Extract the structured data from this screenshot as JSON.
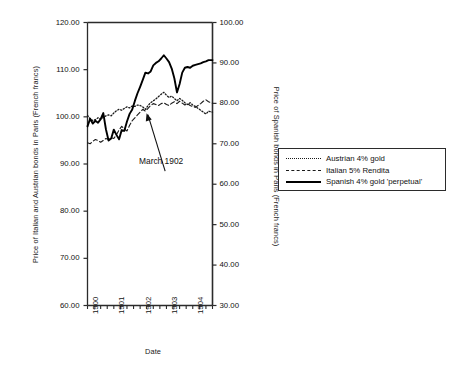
{
  "chart_data": {
    "type": "line",
    "title": "",
    "xlabel": "Date",
    "ylabel": "Price of Italian and Austrian bonds in Paris (French francs)",
    "y2label": "Price of Spanish bonds in Paris (French francs)",
    "xlim": [
      1900.0,
      1904.75
    ],
    "ylim": [
      60.0,
      120.0
    ],
    "y2lim": [
      30.0,
      100.0
    ],
    "grid": false,
    "legend_position": "right",
    "xticks": [
      "1900",
      "1901",
      "1902",
      "1903",
      "1904"
    ],
    "xtick_values": [
      1900,
      1901,
      1902,
      1903,
      1904
    ],
    "yticks": [
      "60.00",
      "70.00",
      "80.00",
      "90.00",
      "100.00",
      "110.00",
      "120.00"
    ],
    "ytick_values": [
      60,
      70,
      80,
      90,
      100,
      110,
      120
    ],
    "y2ticks": [
      "30.00",
      "40.00",
      "50.00",
      "60.00",
      "70.00",
      "80.00",
      "90.00",
      "100.00"
    ],
    "y2tick_values": [
      30,
      40,
      50,
      60,
      70,
      80,
      90,
      100
    ],
    "minor_xticks_per_year": 4,
    "annotations": [
      {
        "text": "March 1902",
        "point_x": 1902.2,
        "point_y": 101.0,
        "label_x": 1902.95,
        "label_y": 88.5
      }
    ],
    "series": [
      {
        "name": "Austrian 4% gold",
        "style": "dotted",
        "axis": "left",
        "color": "#1a1a1a",
        "x": [
          1900.0,
          1900.1,
          1900.2,
          1900.3,
          1900.4,
          1900.5,
          1900.6,
          1900.7,
          1900.8,
          1900.9,
          1901.0,
          1901.1,
          1901.2,
          1901.3,
          1901.4,
          1901.5,
          1901.6,
          1901.7,
          1901.8,
          1901.9,
          1902.0,
          1902.1,
          1902.2,
          1902.3,
          1902.4,
          1902.5,
          1902.6,
          1902.7,
          1902.8,
          1902.9,
          1903.0,
          1903.1,
          1903.2,
          1903.3,
          1903.4,
          1903.5,
          1903.6,
          1903.7,
          1903.8,
          1903.9,
          1904.0,
          1904.1,
          1904.2,
          1904.3,
          1904.4,
          1904.5,
          1904.6,
          1904.75
        ],
        "y": [
          100.3,
          99.6,
          99.2,
          99.4,
          99.8,
          99.5,
          99.9,
          100.2,
          100.4,
          100.2,
          100.8,
          101.3,
          101.6,
          101.4,
          101.8,
          102.1,
          101.9,
          102.3,
          102.2,
          102.5,
          102.4,
          102.1,
          101.6,
          102.4,
          103.0,
          103.4,
          103.8,
          104.3,
          104.8,
          105.2,
          104.6,
          104.1,
          104.4,
          103.9,
          103.4,
          103.9,
          103.5,
          103.0,
          102.6,
          103.0,
          102.5,
          102.2,
          101.8,
          101.4,
          101.0,
          100.6,
          101.2,
          101.0
        ]
      },
      {
        "name": "Italian 5% Rendita",
        "style": "dashed",
        "axis": "left",
        "color": "#1a1a1a",
        "x": [
          1900.0,
          1900.1,
          1900.2,
          1900.3,
          1900.4,
          1900.5,
          1900.6,
          1900.7,
          1900.8,
          1900.9,
          1901.0,
          1901.1,
          1901.2,
          1901.3,
          1901.4,
          1901.5,
          1901.6,
          1901.7,
          1901.8,
          1901.9,
          1902.0,
          1902.1,
          1902.2,
          1902.3,
          1902.4,
          1902.5,
          1902.6,
          1902.7,
          1902.8,
          1902.9,
          1903.0,
          1903.1,
          1903.2,
          1903.3,
          1903.4,
          1903.5,
          1903.6,
          1903.7,
          1903.8,
          1903.9,
          1904.0,
          1904.1,
          1904.2,
          1904.3,
          1904.4,
          1904.5,
          1904.6,
          1904.75
        ],
        "y": [
          94.5,
          94.3,
          94.8,
          95.2,
          95.0,
          94.6,
          95.0,
          95.4,
          95.2,
          95.6,
          95.4,
          96.2,
          97.2,
          98.0,
          97.4,
          97.0,
          98.2,
          99.2,
          99.8,
          100.4,
          101.0,
          101.6,
          101.2,
          101.8,
          102.4,
          102.8,
          102.6,
          102.4,
          102.8,
          103.0,
          102.6,
          102.4,
          102.9,
          103.2,
          102.8,
          103.3,
          102.9,
          102.5,
          102.8,
          102.4,
          102.2,
          102.0,
          102.4,
          102.8,
          103.3,
          103.6,
          103.2,
          102.9
        ]
      },
      {
        "name": "Spanish 4% gold 'perpetual'",
        "style": "solid",
        "axis": "right",
        "color": "#000000",
        "x": [
          1900.0,
          1900.1,
          1900.2,
          1900.3,
          1900.4,
          1900.5,
          1900.6,
          1900.7,
          1900.8,
          1900.9,
          1901.0,
          1901.1,
          1901.2,
          1901.3,
          1901.4,
          1901.5,
          1901.6,
          1901.7,
          1901.8,
          1901.9,
          1902.0,
          1902.1,
          1902.2,
          1902.3,
          1902.4,
          1902.5,
          1902.6,
          1902.7,
          1902.8,
          1902.9,
          1903.0,
          1903.1,
          1903.2,
          1903.3,
          1903.4,
          1903.5,
          1903.6,
          1903.7,
          1903.8,
          1903.9,
          1904.0,
          1904.1,
          1904.2,
          1904.3,
          1904.4,
          1904.5,
          1904.6,
          1904.75
        ],
        "y_left_scale": [
          98.0,
          99.6,
          98.6,
          99.2,
          98.8,
          99.5,
          100.8,
          97.4,
          95.0,
          95.4,
          97.3,
          96.2,
          95.2,
          97.2,
          97.0,
          99.0,
          100.6,
          101.6,
          103.4,
          105.0,
          106.4,
          107.8,
          109.4,
          109.2,
          109.6,
          110.9,
          111.4,
          111.8,
          112.4,
          113.1,
          112.4,
          111.6,
          110.2,
          108.2,
          105.2,
          107.0,
          109.4,
          110.4,
          110.6,
          110.4,
          110.8,
          111.0,
          111.2,
          111.4,
          111.6,
          111.8,
          112.0,
          112.0
        ],
        "y": [
          74.3,
          76.2,
          75.0,
          75.7,
          75.2,
          76.1,
          77.6,
          73.6,
          70.8,
          71.3,
          73.5,
          72.2,
          71.1,
          73.4,
          73.2,
          75.5,
          77.4,
          78.5,
          80.6,
          82.5,
          84.1,
          85.8,
          87.6,
          87.4,
          87.9,
          89.4,
          90.0,
          90.4,
          91.1,
          91.9,
          91.1,
          90.2,
          88.6,
          86.2,
          82.7,
          84.8,
          87.6,
          88.8,
          89.0,
          88.8,
          89.3,
          89.5,
          89.7,
          89.9,
          90.2,
          90.4,
          90.7,
          90.7
        ]
      }
    ]
  },
  "axes": {
    "left_title": "Price of Italian and Austrian bonds in Paris (French francs)",
    "right_title": "Price of Spanish bonds in Paris (French francs)",
    "x_title": "Date"
  },
  "annotation": {
    "text": "March 1902"
  },
  "legend": {
    "items": [
      {
        "label": "Austrian 4% gold",
        "style": "dotted"
      },
      {
        "label": "Italian 5% Rendita",
        "style": "dashed"
      },
      {
        "label": "Spanish 4% gold 'perpetual'",
        "style": "solid"
      }
    ]
  },
  "colors": {
    "axis": "#2b2b2b",
    "line": "#1a1a1a",
    "solid_line": "#000000",
    "background": "#ffffff"
  }
}
